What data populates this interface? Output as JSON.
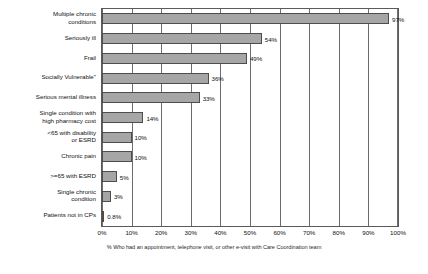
{
  "chart_data": {
    "type": "bar",
    "orientation": "horizontal",
    "title": "",
    "xlabel": "",
    "ylabel": "",
    "xlim": [
      0,
      100
    ],
    "grid": true,
    "legend": null,
    "categories": [
      "Multiple chronic\nconditions",
      "Seriously ill",
      "Frail",
      "Socially Vulnerable\"",
      "Serious mental illness",
      "Single condition with\nhigh pharmacy cost",
      "<65 with disability\nor ESRD",
      "Chronic pain",
      ">=65 with ESRD",
      "Single chronic\ncondition",
      "Patients not in CPs"
    ],
    "values": [
      97,
      54,
      49,
      36,
      33,
      14,
      10,
      10,
      5,
      3,
      0.8
    ],
    "value_labels": [
      "97%",
      "54%",
      "49%",
      "36%",
      "33%",
      "14%",
      "10%",
      "10%",
      "5%",
      "3%",
      "0.8%"
    ],
    "x_ticks": [
      0,
      10,
      20,
      30,
      40,
      50,
      60,
      70,
      80,
      90,
      100
    ],
    "x_tick_labels": [
      "0%",
      "10%",
      "20%",
      "30%",
      "40%",
      "50%",
      "60%",
      "70%",
      "80%",
      "90%",
      "100%"
    ],
    "bar_color": "#a6a6a6",
    "bar_border_color": "#4d4d4d",
    "axis_color": "#5a5a5a"
  },
  "caption": {
    "text": "% Who had an appointment, telephone visit, or other e-visit with Care Coordination team"
  }
}
